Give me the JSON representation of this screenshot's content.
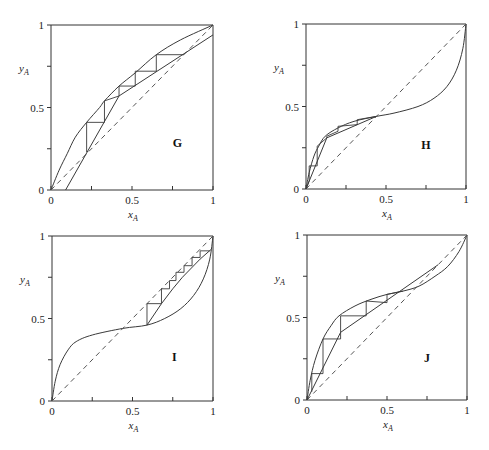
{
  "chart_data": [
    {
      "type": "line",
      "title": "G",
      "xlabel": "x_A",
      "ylabel": "y_A",
      "xlim": [
        0,
        1
      ],
      "ylim": [
        0,
        1
      ],
      "x_ticks": [
        "0",
        "0.5",
        "1"
      ],
      "y_ticks": [
        "0",
        "0.5",
        "1"
      ],
      "grid": false,
      "series": [
        {
          "name": "equilibrium",
          "style": "solid",
          "points": [
            [
              0,
              0
            ],
            [
              0.05,
              0.12
            ],
            [
              0.1,
              0.22
            ],
            [
              0.15,
              0.32
            ],
            [
              0.22,
              0.41
            ],
            [
              0.3,
              0.5
            ],
            [
              0.33,
              0.54
            ],
            [
              0.42,
              0.63
            ],
            [
              0.52,
              0.71
            ],
            [
              0.65,
              0.82
            ],
            [
              0.8,
              0.91
            ],
            [
              1,
              1
            ]
          ]
        },
        {
          "name": "diagonal",
          "style": "dashed",
          "points": [
            [
              0,
              0
            ],
            [
              1,
              1
            ]
          ]
        },
        {
          "name": "operating-line",
          "style": "solid",
          "points": [
            [
              0.09,
              0
            ],
            [
              0.42,
              0.57
            ],
            [
              1,
              0.94
            ]
          ]
        },
        {
          "name": "stages",
          "style": "solid",
          "points": [
            [
              0.82,
              0.82
            ],
            [
              0.65,
              0.82
            ],
            [
              0.65,
              0.72
            ],
            [
              0.52,
              0.72
            ],
            [
              0.52,
              0.63
            ],
            [
              0.42,
              0.63
            ],
            [
              0.42,
              0.57
            ],
            [
              0.33,
              0.54
            ],
            [
              0.33,
              0.41
            ],
            [
              0.22,
              0.41
            ],
            [
              0.22,
              0.23
            ]
          ]
        }
      ],
      "label_pos": [
        0.78,
        0.26
      ]
    },
    {
      "type": "line",
      "title": "H",
      "xlabel": "x_A",
      "ylabel": "y_A",
      "xlim": [
        0,
        1
      ],
      "ylim": [
        0,
        1
      ],
      "x_ticks": [
        "0",
        "0.5",
        "1"
      ],
      "y_ticks": [
        "0",
        "0.5",
        "1"
      ],
      "grid": false,
      "series": [
        {
          "name": "equilibrium",
          "style": "solid",
          "points": [
            [
              0,
              0
            ],
            [
              0.02,
              0.1
            ],
            [
              0.05,
              0.2
            ],
            [
              0.08,
              0.26
            ],
            [
              0.12,
              0.32
            ],
            [
              0.2,
              0.37
            ],
            [
              0.3,
              0.41
            ],
            [
              0.44,
              0.44
            ],
            [
              0.55,
              0.46
            ],
            [
              0.7,
              0.5
            ],
            [
              0.8,
              0.55
            ],
            [
              0.88,
              0.62
            ],
            [
              0.94,
              0.72
            ],
            [
              0.98,
              0.85
            ],
            [
              1,
              1
            ]
          ]
        },
        {
          "name": "diagonal",
          "style": "dashed",
          "points": [
            [
              0,
              0
            ],
            [
              1,
              1
            ]
          ]
        },
        {
          "name": "operating-line",
          "style": "solid",
          "points": [
            [
              0,
              0
            ],
            [
              0.13,
              0.31
            ],
            [
              0.44,
              0.44
            ]
          ]
        },
        {
          "name": "stages",
          "style": "solid",
          "points": [
            [
              0.44,
              0.44
            ],
            [
              0.32,
              0.42
            ],
            [
              0.32,
              0.39
            ],
            [
              0.2,
              0.38
            ],
            [
              0.2,
              0.35
            ],
            [
              0.13,
              0.32
            ],
            [
              0.13,
              0.31
            ],
            [
              0.07,
              0.26
            ],
            [
              0.07,
              0.14
            ],
            [
              0.02,
              0.14
            ],
            [
              0.02,
              0.05
            ],
            [
              0,
              0
            ]
          ]
        }
      ],
      "label_pos": [
        0.75,
        0.24
      ]
    },
    {
      "type": "line",
      "title": "I",
      "xlabel": "x_A",
      "ylabel": "y_A",
      "xlim": [
        0,
        1
      ],
      "ylim": [
        0,
        1
      ],
      "x_ticks": [
        "0",
        "0.5",
        "1"
      ],
      "y_ticks": [
        "0",
        "0.5",
        "1"
      ],
      "grid": false,
      "series": [
        {
          "name": "equilibrium",
          "style": "solid",
          "points": [
            [
              0,
              0
            ],
            [
              0.02,
              0.12
            ],
            [
              0.05,
              0.22
            ],
            [
              0.1,
              0.31
            ],
            [
              0.15,
              0.36
            ],
            [
              0.25,
              0.4
            ],
            [
              0.44,
              0.44
            ],
            [
              0.59,
              0.46
            ],
            [
              0.7,
              0.5
            ],
            [
              0.8,
              0.56
            ],
            [
              0.88,
              0.64
            ],
            [
              0.94,
              0.74
            ],
            [
              0.98,
              0.86
            ],
            [
              1,
              1
            ]
          ]
        },
        {
          "name": "diagonal",
          "style": "dashed",
          "points": [
            [
              0,
              0
            ],
            [
              1,
              1
            ]
          ]
        },
        {
          "name": "operating-line",
          "style": "solid",
          "points": [
            [
              0.59,
              0.46
            ],
            [
              0.68,
              0.59
            ],
            [
              0.75,
              0.68
            ],
            [
              0.81,
              0.75
            ],
            [
              0.86,
              0.8
            ],
            [
              0.92,
              0.86
            ],
            [
              0.99,
              0.92
            ]
          ]
        },
        {
          "name": "stages",
          "style": "solid",
          "points": [
            [
              0.59,
              0.46
            ],
            [
              0.59,
              0.59
            ],
            [
              0.68,
              0.59
            ],
            [
              0.68,
              0.68
            ],
            [
              0.73,
              0.68
            ],
            [
              0.73,
              0.73
            ],
            [
              0.77,
              0.73
            ],
            [
              0.77,
              0.78
            ],
            [
              0.82,
              0.78
            ],
            [
              0.82,
              0.82
            ],
            [
              0.87,
              0.82
            ],
            [
              0.87,
              0.87
            ],
            [
              0.92,
              0.87
            ],
            [
              0.92,
              0.91
            ],
            [
              0.98,
              0.91
            ]
          ]
        }
      ],
      "label_pos": [
        0.76,
        0.24
      ]
    },
    {
      "type": "line",
      "title": "J",
      "xlabel": "x_A",
      "ylabel": "y_A",
      "xlim": [
        0,
        1
      ],
      "ylim": [
        0,
        1
      ],
      "x_ticks": [
        "0",
        "0.5",
        "1"
      ],
      "y_ticks": [
        "0",
        "0.5",
        "1"
      ],
      "grid": false,
      "series": [
        {
          "name": "equilibrium",
          "style": "solid",
          "points": [
            [
              0,
              0
            ],
            [
              0.02,
              0.12
            ],
            [
              0.05,
              0.24
            ],
            [
              0.1,
              0.37
            ],
            [
              0.15,
              0.45
            ],
            [
              0.2,
              0.51
            ],
            [
              0.3,
              0.57
            ],
            [
              0.4,
              0.61
            ],
            [
              0.5,
              0.64
            ],
            [
              0.6,
              0.66
            ],
            [
              0.7,
              0.69
            ],
            [
              0.8,
              0.75
            ],
            [
              0.88,
              0.81
            ],
            [
              0.95,
              0.9
            ],
            [
              1,
              1
            ]
          ]
        },
        {
          "name": "diagonal",
          "style": "dashed",
          "points": [
            [
              0,
              0
            ],
            [
              1,
              1
            ]
          ]
        },
        {
          "name": "operating-line",
          "style": "solid",
          "points": [
            [
              0,
              0
            ],
            [
              0.21,
              0.41
            ],
            [
              0.82,
              0.82
            ]
          ]
        },
        {
          "name": "stages",
          "style": "solid",
          "points": [
            [
              0.6,
              0.66
            ],
            [
              0.5,
              0.64
            ],
            [
              0.5,
              0.59
            ],
            [
              0.37,
              0.6
            ],
            [
              0.37,
              0.51
            ],
            [
              0.21,
              0.51
            ],
            [
              0.21,
              0.37
            ],
            [
              0.1,
              0.37
            ],
            [
              0.1,
              0.16
            ],
            [
              0.03,
              0.16
            ],
            [
              0.03,
              0.05
            ]
          ]
        }
      ],
      "label_pos": [
        0.75,
        0.23
      ]
    }
  ],
  "panels": [
    {
      "id": "G",
      "label": "G",
      "box": {
        "x0": 51,
        "x1": 213,
        "y0": 190,
        "y1": 25
      }
    },
    {
      "id": "H",
      "label": "H",
      "box": {
        "x0": 306,
        "x1": 466,
        "y0": 189,
        "y1": 24
      }
    },
    {
      "id": "I",
      "label": "I",
      "box": {
        "x0": 52,
        "x1": 213,
        "y0": 401,
        "y1": 236
      }
    },
    {
      "id": "J",
      "label": "J",
      "box": {
        "x0": 307,
        "x1": 467,
        "y0": 400,
        "y1": 235
      }
    }
  ],
  "axis_text": {
    "x_main": "x",
    "x_sub": "A",
    "y_main": "y",
    "y_sub": "A"
  }
}
